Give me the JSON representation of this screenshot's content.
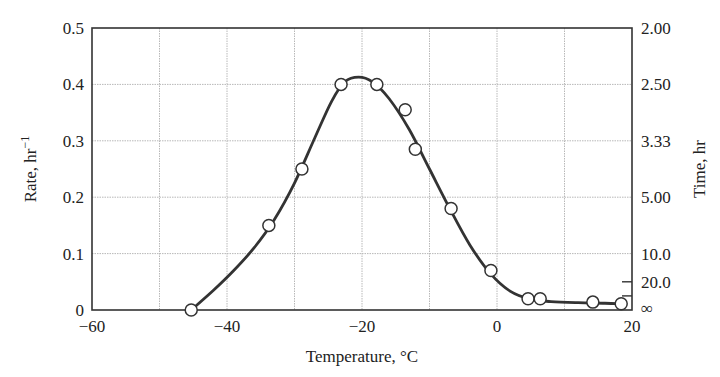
{
  "chart_data": {
    "type": "line",
    "title": "",
    "xlabel": "Temperature, °C",
    "ylabel": "Rate, hr",
    "ylabel_superscript": "−1",
    "y2label": "Time, hr",
    "xlim": [
      -60,
      20
    ],
    "ylim": [
      0,
      0.5
    ],
    "grid": true,
    "legend": null,
    "x_ticks": [
      -60,
      -50,
      -40,
      -30,
      -20,
      -10,
      0,
      10,
      20
    ],
    "x_tick_labels": [
      {
        "value": -60,
        "label": "−60"
      },
      {
        "value": -40,
        "label": "−40"
      },
      {
        "value": -20,
        "label": "−20"
      },
      {
        "value": 0,
        "label": "0"
      },
      {
        "value": 20,
        "label": "20"
      }
    ],
    "y_tick_labels": [
      {
        "value": 0,
        "label": "0"
      },
      {
        "value": 0.1,
        "label": "0.1"
      },
      {
        "value": 0.2,
        "label": "0.2"
      },
      {
        "value": 0.3,
        "label": "0.3"
      },
      {
        "value": 0.4,
        "label": "0.4"
      },
      {
        "value": 0.5,
        "label": "0.5"
      }
    ],
    "y2_tick_labels": [
      {
        "rate": 0.5,
        "label": "2.00"
      },
      {
        "rate": 0.4,
        "label": "2.50"
      },
      {
        "rate": 0.3,
        "label": "3.33"
      },
      {
        "rate": 0.2,
        "label": "5.00"
      },
      {
        "rate": 0.1,
        "label": "10.0"
      },
      {
        "rate": 0.05,
        "label": "20.0"
      },
      {
        "rate": 0.0,
        "label": "∞"
      }
    ],
    "y2_minor_ticks": [
      0.05,
      0.025
    ],
    "series": [
      {
        "name": "measured rate",
        "style": "open-circle markers",
        "x": [
          -45.3,
          -33.8,
          -28.9,
          -23.1,
          -17.8,
          -13.6,
          -12.1,
          -6.8,
          -0.9,
          4.6,
          6.4,
          14.2,
          18.4
        ],
        "y": [
          0.0,
          0.15,
          0.25,
          0.4,
          0.4,
          0.355,
          0.285,
          0.18,
          0.07,
          0.02,
          0.02,
          0.014,
          0.011
        ]
      },
      {
        "name": "fitted curve",
        "style": "solid line",
        "x": [
          -45.3,
          -42,
          -39,
          -36,
          -33,
          -30,
          -27,
          -24.5,
          -22.5,
          -20.5,
          -18.5,
          -16,
          -13,
          -10,
          -7,
          -4,
          -1,
          2,
          5,
          8,
          12,
          16,
          18.4
        ],
        "y": [
          0.0,
          0.035,
          0.07,
          0.11,
          0.16,
          0.225,
          0.305,
          0.37,
          0.405,
          0.413,
          0.405,
          0.375,
          0.32,
          0.25,
          0.18,
          0.115,
          0.065,
          0.033,
          0.019,
          0.015,
          0.013,
          0.012,
          0.011
        ]
      }
    ]
  }
}
